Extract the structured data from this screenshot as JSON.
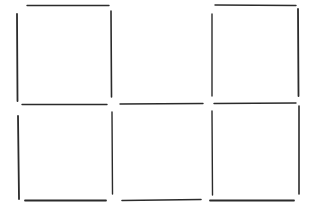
{
  "drawing": {
    "description": "Hand-drawn 3 by 2 grid of squares made of separate pen strokes",
    "columns": 3,
    "rows": 2,
    "stroke_color": "#2b2b2b",
    "background_color": "#ffffff",
    "missing_edges": [
      "top edge of middle column"
    ]
  }
}
